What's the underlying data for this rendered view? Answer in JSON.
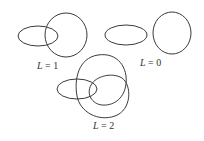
{
  "figure": {
    "panels": [
      {
        "id": "L1",
        "label_var": "L",
        "label_eq": " = 1",
        "description": "ellipse and circle linked once"
      },
      {
        "id": "L0",
        "label_var": "L",
        "label_eq": " = 0",
        "description": "ellipse and circle unlinked"
      },
      {
        "id": "L2",
        "label_var": "L",
        "label_eq": " = 2",
        "description": "ellipse and looped curve linked twice"
      }
    ],
    "stroke_color": "#3a3a3a"
  }
}
